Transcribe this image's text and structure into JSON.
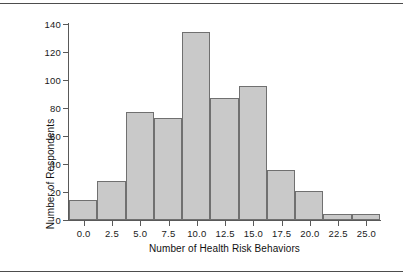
{
  "chart_data": {
    "type": "bar",
    "title": "",
    "subtitle": "",
    "xlabel": "Number of Health Risk Behaviors",
    "ylabel": "Number of Respondents",
    "grid": false,
    "legend": false,
    "xlim": [
      -1.3,
      26.2
    ],
    "ylim": [
      0,
      140
    ],
    "bin_width": 2.5,
    "xticks": [
      "0.0",
      "2.5",
      "5.0",
      "7.5",
      "10.0",
      "12.5",
      "15.0",
      "17.5",
      "20.0",
      "22.5",
      "25.0"
    ],
    "xtick_values": [
      0,
      2.5,
      5,
      7.5,
      10,
      12.5,
      15,
      17.5,
      20,
      22.5,
      25
    ],
    "yticks": [
      "0",
      "20",
      "40",
      "60",
      "80",
      "100",
      "120",
      "140"
    ],
    "ytick_values": [
      0,
      20,
      40,
      60,
      80,
      100,
      120,
      140
    ],
    "bins": [
      {
        "start": -1.3,
        "end": 1.2,
        "value": 14
      },
      {
        "start": 1.2,
        "end": 3.7,
        "value": 28
      },
      {
        "start": 3.7,
        "end": 6.2,
        "value": 77
      },
      {
        "start": 6.2,
        "end": 8.7,
        "value": 73
      },
      {
        "start": 8.7,
        "end": 11.2,
        "value": 134
      },
      {
        "start": 11.2,
        "end": 13.7,
        "value": 87
      },
      {
        "start": 13.7,
        "end": 16.2,
        "value": 96
      },
      {
        "start": 16.2,
        "end": 18.7,
        "value": 36
      },
      {
        "start": 18.7,
        "end": 21.2,
        "value": 21
      },
      {
        "start": 21.2,
        "end": 23.7,
        "value": 4
      },
      {
        "start": 23.7,
        "end": 26.2,
        "value": 4
      }
    ],
    "values": [
      14,
      28,
      77,
      73,
      134,
      87,
      96,
      36,
      21,
      4,
      4
    ],
    "colors": {
      "bar_fill": "#c9c9c9",
      "bar_edge": "#707070",
      "axis": "#595959",
      "text": "#111111",
      "rule": "#4d4d4d",
      "background": "#ffffff"
    }
  }
}
